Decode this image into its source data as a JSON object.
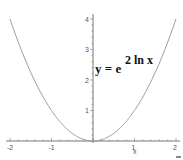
{
  "chart_data": {
    "type": "line",
    "title": "",
    "annotation": {
      "base": "y = e",
      "exponent": "2 ln x",
      "full": "y = e^(2 ln x)"
    },
    "xlabel": "x",
    "ylabel": "",
    "xlim": [
      -2,
      2
    ],
    "ylim": [
      0,
      4
    ],
    "grid": false,
    "legend": "none",
    "x_ticks": [
      -2,
      -1,
      1,
      2
    ],
    "y_ticks": [
      1,
      2,
      3,
      4
    ],
    "x_tick_labels": [
      "-2",
      "-1",
      "1",
      "2"
    ],
    "y_tick_labels": [
      "1",
      "2",
      "3",
      "4"
    ],
    "series": [
      {
        "name": "y = x^2",
        "color": "#9a9a9a",
        "x": [
          -2,
          -1.75,
          -1.5,
          -1.25,
          -1,
          -0.75,
          -0.5,
          -0.25,
          0,
          0.25,
          0.5,
          0.75,
          1,
          1.25,
          1.5,
          1.75,
          2
        ],
        "y": [
          4,
          3.0625,
          2.25,
          1.5625,
          1,
          0.5625,
          0.25,
          0.0625,
          0,
          0.0625,
          0.25,
          0.5625,
          1,
          1.5625,
          2.25,
          3.0625,
          4
        ]
      }
    ],
    "colors": {
      "axis": "#777777",
      "curve": "#9a9a9a",
      "text": "#111111"
    }
  }
}
